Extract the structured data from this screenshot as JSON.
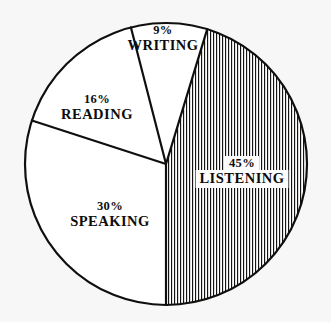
{
  "chart_data": {
    "type": "pie",
    "title": "",
    "subtitle": "",
    "xlabel": "",
    "ylabel": "",
    "legend_position": "none",
    "grid": false,
    "labels_inside": true,
    "categories": [
      "LISTENING",
      "SPEAKING",
      "READING",
      "WRITING"
    ],
    "values": [
      45,
      30,
      16,
      9
    ],
    "unit": "%",
    "total": 100,
    "slices": [
      {
        "name": "LISTENING",
        "value": 45,
        "percent_text": "45%",
        "label_text": "LISTENING",
        "start_angle": 17,
        "end_angle": 180,
        "sweep_deg": 163,
        "fill_style": "vertical-hatch",
        "fill_color": "#ffffff",
        "hatch_color": "#141312",
        "label_cx": 242,
        "label_cy": 167
      },
      {
        "name": "SPEAKING",
        "value": 30,
        "percent_text": "30%",
        "label_text": "SPEAKING",
        "start_angle": 180,
        "end_angle": 288,
        "sweep_deg": 108,
        "fill_style": "plain",
        "fill_color": "#ffffff",
        "hatch_color": "",
        "label_cx": 110,
        "label_cy": 210
      },
      {
        "name": "READING",
        "value": 16,
        "percent_text": "16%",
        "label_text": "READING",
        "start_angle": 288,
        "end_angle": 345.6,
        "sweep_deg": 57.6,
        "fill_style": "plain",
        "fill_color": "#ffffff",
        "hatch_color": "",
        "label_cx": 97,
        "label_cy": 103
      },
      {
        "name": "WRITING",
        "value": 9,
        "percent_text": "9%",
        "label_text": "WRITING",
        "start_angle": 345.6,
        "end_angle": 377,
        "sweep_deg": 31.4,
        "fill_style": "plain",
        "fill_color": "#ffffff",
        "hatch_color": "",
        "label_cx": 163,
        "label_cy": 34
      }
    ],
    "geometry": {
      "center_x": 166,
      "center_y": 164,
      "radius": 141,
      "outline_color": "#100f0e",
      "outline_width": 2.2,
      "background_color": "#f7f7f8"
    }
  }
}
